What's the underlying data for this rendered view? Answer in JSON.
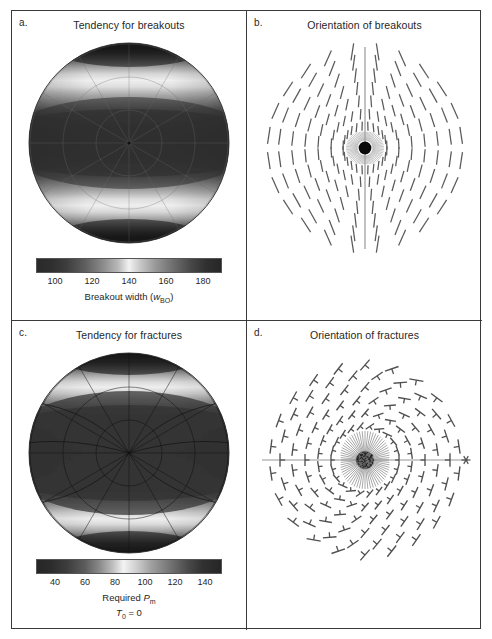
{
  "figure": {
    "layout": "2x2 panel grid",
    "panels": [
      {
        "letter": "a.",
        "title": "Tendency for breakouts",
        "plot_type": "polar-stereographic-grayscale",
        "colorbar": {
          "label_main": "Breakout width (",
          "label_var": "w",
          "label_sub": "BO",
          "label_close": ")",
          "ticks": [
            "100",
            "120",
            "140",
            "160",
            "180"
          ],
          "vmin": 90,
          "vmax": 190
        }
      },
      {
        "letter": "b.",
        "title": "Orientation of breakouts",
        "plot_type": "polar-tick-orientation"
      },
      {
        "letter": "c.",
        "title": "Tendency for fractures",
        "plot_type": "polar-stereographic-grayscale",
        "colorbar": {
          "label_main": "Required ",
          "label_var": "P",
          "label_sub": "m",
          "label_close": "",
          "label_line2_var": "T",
          "label_line2_sub": "0",
          "label_line2_rest": " = 0",
          "ticks": [
            "40",
            "60",
            "80",
            "100",
            "120",
            "140"
          ],
          "vmin": 30,
          "vmax": 150
        }
      },
      {
        "letter": "d.",
        "title": "Orientation of fractures",
        "plot_type": "polar-cross-orientation"
      }
    ]
  },
  "chart_data": [
    {
      "type": "heatmap",
      "panel": "a",
      "title": "Tendency for breakouts",
      "projection": "lower-hemisphere stereographic",
      "colormap": "gray-light-gray (dark-bright-dark)",
      "cbar_label": "Breakout width (w_BO)",
      "cbar_ticks": [
        100,
        120,
        140,
        160,
        180
      ],
      "cbar_range": [
        90,
        190
      ],
      "description": "Dark core band across the equator, bright horizontal bands above and below, dark polar caps; symmetric about horizontal axis",
      "grid": true,
      "radial_gridlines": 12,
      "circular_gridlines": 3
    },
    {
      "type": "scatter",
      "panel": "b",
      "title": "Orientation of breakouts",
      "marker": "line-segment (bar) tick",
      "description": "Radial grid of short line-segment ticks indicating breakout azimuth; near-vertical along the horizontal meridian, fanning to follow small-circle trajectories toward the poles; solid black disc at center with fine radial hairs",
      "rings": 7,
      "azimuths_per_ring": 24,
      "center_marker": "filled-black-disc",
      "center_line": "vertical"
    },
    {
      "type": "heatmap",
      "panel": "c",
      "title": "Tendency for fractures",
      "projection": "lower-hemisphere stereographic",
      "colormap": "gray-light-gray (dark-bright-dark)",
      "cbar_label": "Required P_m, T_0 = 0",
      "cbar_ticks": [
        40,
        60,
        80,
        100,
        120,
        140
      ],
      "cbar_range": [
        30,
        150
      ],
      "description": "Large dark interior with bright crescent bands near the top and bottom rims; dark outer caps at north and south",
      "grid": true,
      "radial_gridlines": 12,
      "circular_gridlines": 3
    },
    {
      "type": "scatter",
      "panel": "d",
      "title": "Orientation of fractures",
      "marker": "cross / T-shaped tick pair",
      "description": "Radial grid of cross- and T-shaped tick markers indicating fracture strike and dip; arranged on concentric rings; gray stippled disc at center with radial hairs; horizontal line across full diameter",
      "rings": 7,
      "azimuths_per_ring": 24,
      "center_marker": "stippled-gray-disc",
      "center_line": "horizontal"
    }
  ],
  "colors": {
    "frame": "#3a3a3a",
    "text": "#1f1f1f",
    "tick_mark": "#4a4a4a",
    "background": "#ffffff"
  }
}
